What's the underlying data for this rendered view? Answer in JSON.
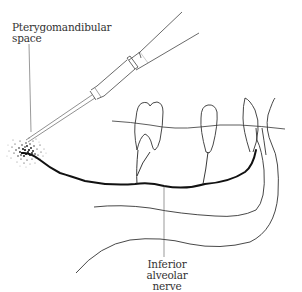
{
  "diagram": {
    "labels": {
      "pterygomandibular": {
        "line1": "Pterygomandibular",
        "line2": "space"
      },
      "inferior_alveolar": {
        "line1": "Inferior alveolar",
        "line2": "nerve"
      }
    },
    "elements": [
      "syringe",
      "needle",
      "anesthetic-diffusion-cloud",
      "inferior-alveolar-nerve",
      "molar-teeth",
      "mandible-outline",
      "gum-line"
    ],
    "colors": {
      "line": "#333333",
      "nerve": "#111111",
      "background": "#ffffff"
    }
  }
}
